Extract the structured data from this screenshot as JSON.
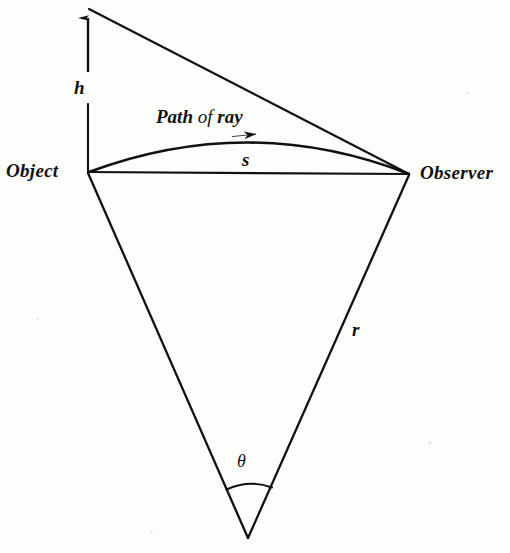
{
  "figure": {
    "background_color": "#fdfdfc",
    "ink_color": "#111111"
  },
  "labels": {
    "object": "Object",
    "observer": "Observer",
    "height": "h",
    "chord": "s",
    "radius": "r",
    "angle": "θ",
    "path_word1": "Path",
    "path_word2": "of",
    "path_word3": "ray"
  },
  "diagram_data": {
    "type": "geometric-diagram",
    "vertices": {
      "object": [
        88,
        172
      ],
      "observer": [
        409,
        174
      ],
      "height_apex": [
        88,
        8
      ],
      "earth_center": [
        248,
        538
      ]
    },
    "segments": [
      {
        "name": "height-arrow",
        "from": [
          88,
          172
        ],
        "to": [
          88,
          8
        ],
        "arrowhead_at": "to",
        "broken_by_label": true
      },
      {
        "name": "apex-to-observer",
        "from": [
          88,
          8
        ],
        "to": [
          409,
          174
        ]
      },
      {
        "name": "chord-s",
        "from": [
          88,
          172
        ],
        "to": [
          409,
          174
        ]
      },
      {
        "name": "radius-left",
        "from": [
          88,
          172
        ],
        "to": [
          248,
          538
        ]
      },
      {
        "name": "radius-right",
        "from": [
          409,
          174
        ],
        "to": [
          248,
          538
        ]
      }
    ],
    "curves": [
      {
        "name": "ray-path",
        "from": [
          88,
          172
        ],
        "to": [
          409,
          174
        ],
        "apex": [
          250,
          134
        ],
        "arrowhead_at": [
          256,
          136
        ]
      },
      {
        "name": "theta-arc",
        "from": [
          226,
          489
        ],
        "to": [
          272,
          487
        ],
        "bulge": "upward"
      }
    ]
  }
}
